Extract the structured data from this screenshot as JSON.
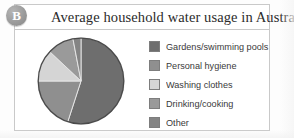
{
  "figure": {
    "badge_letter": "B",
    "title": "Average household water usage in Australia"
  },
  "chart_data": {
    "type": "pie",
    "title": "Average household water usage in Australia",
    "xlabel": "",
    "ylabel": "",
    "legend_position": "right",
    "grid": false,
    "categories": [
      "Gardens/swimming pools",
      "Personal hygiene",
      "Washing clothes",
      "Drinking/cooking",
      "Other"
    ],
    "values": [
      55,
      20,
      12,
      10,
      3
    ],
    "colors": [
      "#6e6e6e",
      "#8f8f8f",
      "#d5d5d5",
      "#9a9a9a",
      "#848484"
    ],
    "start_angle_deg": -90,
    "direction": "clockwise",
    "units": "percent"
  },
  "legend": {
    "items": [
      {
        "label": "Gardens/swimming pools",
        "color": "#6e6e6e"
      },
      {
        "label": "Personal hygiene",
        "color": "#8f8f8f"
      },
      {
        "label": "Washing clothes",
        "color": "#d5d5d5"
      },
      {
        "label": "Drinking/cooking",
        "color": "#9a9a9a"
      },
      {
        "label": "Other",
        "color": "#848484"
      }
    ]
  },
  "style": {
    "panel_border": "#c9c9c9",
    "pie_outline": "#4a4a4a",
    "slice_divider": "#e8e8e8"
  }
}
